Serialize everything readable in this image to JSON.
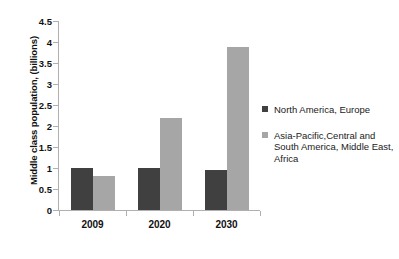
{
  "chart_data": {
    "type": "bar",
    "title": "",
    "subtitle": "",
    "xlabel": "",
    "ylabel": "Middle class population, (billions)",
    "categories": [
      "2009",
      "2020",
      "2030"
    ],
    "series": [
      {
        "name": "North America, Europe",
        "color": "#404040",
        "values": [
          1.0,
          1.01,
          0.96
        ]
      },
      {
        "name": "Asia-Pacific,Central and South America, Middle East, Africa",
        "color": "#a6a6a6",
        "values": [
          0.81,
          2.19,
          3.87
        ]
      }
    ],
    "ylim": [
      0,
      4.5
    ],
    "y_ticks": [
      "0",
      "0.5",
      "1",
      "1.5",
      "2",
      "2.5",
      "3",
      "3.5",
      "4",
      "4.5"
    ],
    "y_tick_values": [
      0,
      0.5,
      1,
      1.5,
      2,
      2.5,
      3,
      3.5,
      4,
      4.5
    ],
    "grid": false,
    "legend_position": "right"
  },
  "legend": {
    "entries": [
      {
        "label": "North America, Europe",
        "color": "#404040"
      },
      {
        "label": "Asia-Pacific,Central and South America, Middle East, Africa",
        "color": "#a6a6a6"
      }
    ]
  }
}
